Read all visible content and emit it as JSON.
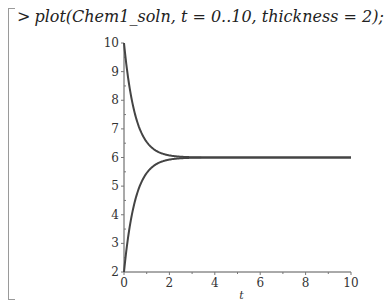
{
  "worksheet": {
    "prompt": ">",
    "command": "plot(Chem1_soln, t = 0..10, thickness = 2);"
  },
  "chart_data": {
    "type": "line",
    "title": "",
    "xlabel": "t",
    "ylabel": "",
    "xlim": [
      0,
      10
    ],
    "ylim": [
      2,
      10
    ],
    "x_ticks": [
      0,
      2,
      4,
      6,
      8,
      10
    ],
    "y_ticks": [
      2,
      3,
      4,
      5,
      6,
      7,
      8,
      9,
      10
    ],
    "grid": false,
    "legend": null,
    "line_color": "#444444",
    "series": [
      {
        "name": "decaying",
        "description": "6 + 4*exp(-2t)",
        "x": [
          0,
          0.25,
          0.5,
          0.75,
          1,
          1.5,
          2,
          2.5,
          3,
          4,
          5,
          6,
          8,
          10
        ],
        "values": [
          10,
          8.43,
          7.47,
          6.89,
          6.54,
          6.2,
          6.07,
          6.03,
          6.01,
          6.0,
          6.0,
          6.0,
          6.0,
          6.0
        ]
      },
      {
        "name": "rising",
        "description": "6 - 4*exp(-2t)",
        "x": [
          0,
          0.25,
          0.5,
          0.75,
          1,
          1.5,
          2,
          2.5,
          3,
          4,
          5,
          6,
          8,
          10
        ],
        "values": [
          2,
          3.57,
          4.53,
          5.11,
          5.46,
          5.8,
          5.93,
          5.97,
          5.99,
          6.0,
          6.0,
          6.0,
          6.0,
          6.0
        ]
      }
    ]
  }
}
